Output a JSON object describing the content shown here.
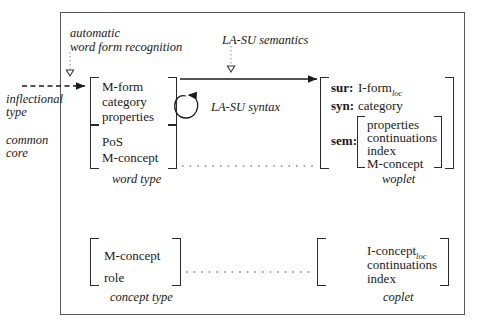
{
  "diagram": {
    "annotations": {
      "automatic_line1": "automatic",
      "automatic_line2": "word form recognition",
      "la_su_semantics": "LA-SU semantics",
      "la_su_syntax": "LA-SU syntax",
      "inflectional_line1": "inflectional",
      "inflectional_line2": "type",
      "common_line1": "common",
      "common_line2": "core"
    },
    "word_type": {
      "caption": "word type",
      "upper_rows": [
        "M-form",
        "category",
        "properties"
      ],
      "lower_rows": [
        "PoS",
        "M-concept"
      ]
    },
    "woplet": {
      "caption": "woplet",
      "sur_key": "sur:",
      "sur_value": "I-form",
      "sur_value_sub": "loc",
      "syn_key": "syn:",
      "syn_value": "category",
      "sem_key": "sem:",
      "sem_rows": [
        "properties",
        "continuations",
        "index",
        "M-concept"
      ]
    },
    "concept_type": {
      "caption": "concept type",
      "rows": [
        "M-concept",
        "role"
      ]
    },
    "coplet": {
      "caption": "coplet",
      "row1": "I-concept",
      "row1_sub": "loc",
      "rows_rest": [
        "continuations",
        "index"
      ]
    },
    "colors": {
      "frame": "#5a5a5a",
      "ink": "#1a1a1a",
      "bracket": "#2a2a2a",
      "dotted": "#8a8a8a"
    }
  }
}
